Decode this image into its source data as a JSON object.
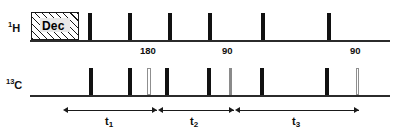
{
  "figure": {
    "type": "nmr-pulse-sequence",
    "width": 398,
    "height": 133,
    "background": "#ffffff"
  },
  "channels": [
    {
      "id": "proton",
      "label_sup": "1",
      "label_main": "H",
      "label_x": 8,
      "label_y": 21,
      "baseline": {
        "x": 30,
        "y": 40,
        "width": 360
      }
    },
    {
      "id": "carbon",
      "label_sup": "13",
      "label_main": "C",
      "label_x": 6,
      "label_y": 78,
      "baseline": {
        "x": 30,
        "y": 95,
        "width": 360
      }
    }
  ],
  "decoupling": {
    "label": "Dec",
    "x": 31,
    "y": 12,
    "width": 48,
    "height": 28,
    "text_x": 42,
    "text_y": 21
  },
  "proton_pulses": [
    {
      "x": 88,
      "y": 13,
      "width": 4,
      "height": 27,
      "style": "solid"
    },
    {
      "x": 128,
      "y": 13,
      "width": 4,
      "height": 27,
      "style": "solid"
    },
    {
      "x": 168,
      "y": 13,
      "width": 4,
      "height": 27,
      "style": "solid"
    },
    {
      "x": 208,
      "y": 13,
      "width": 4,
      "height": 27,
      "style": "solid"
    },
    {
      "x": 261,
      "y": 13,
      "width": 4,
      "height": 27,
      "style": "solid"
    },
    {
      "x": 327,
      "y": 13,
      "width": 4,
      "height": 27,
      "style": "solid"
    }
  ],
  "carbon_pulses": [
    {
      "x": 89,
      "y": 68,
      "width": 4,
      "height": 27,
      "style": "solid"
    },
    {
      "x": 128,
      "y": 68,
      "width": 4,
      "height": 27,
      "style": "solid"
    },
    {
      "x": 147,
      "y": 68,
      "width": 4,
      "height": 27,
      "style": "open"
    },
    {
      "x": 165,
      "y": 68,
      "width": 4,
      "height": 27,
      "style": "solid"
    },
    {
      "x": 207,
      "y": 68,
      "width": 4,
      "height": 27,
      "style": "solid"
    },
    {
      "x": 229,
      "y": 68,
      "width": 3,
      "height": 27,
      "style": "gray"
    },
    {
      "x": 260,
      "y": 68,
      "width": 4,
      "height": 27,
      "style": "solid"
    },
    {
      "x": 325,
      "y": 68,
      "width": 4,
      "height": 27,
      "style": "solid"
    },
    {
      "x": 356,
      "y": 68,
      "width": 3,
      "height": 27,
      "style": "open"
    }
  ],
  "flip_angles": [
    {
      "text": "180",
      "x": 140,
      "y": 46
    },
    {
      "text": "90",
      "x": 222,
      "y": 46
    },
    {
      "text": "90",
      "x": 350,
      "y": 46
    }
  ],
  "timings": [
    {
      "label": "t",
      "sub": "1",
      "line_x": 65,
      "line_y": 110,
      "line_width": 92,
      "left_cap": "arrow",
      "right_cap": "arrow",
      "label_x": 105,
      "label_y": 116
    },
    {
      "label": "t",
      "sub": "2",
      "line_x": 160,
      "line_y": 110,
      "line_width": 74,
      "left_cap": "arrow",
      "right_cap": "arrow",
      "label_x": 190,
      "label_y": 116
    },
    {
      "label": "t",
      "sub": "3",
      "line_x": 237,
      "line_y": 110,
      "line_width": 122,
      "left_cap": "arrow",
      "right_cap": "arrow",
      "label_x": 292,
      "label_y": 116
    }
  ],
  "colors": {
    "ink": "#111111",
    "gray_pulse": "#8a8a8a",
    "open_pulse_border": "#8f8f8f",
    "baseline": "#2b2b2b"
  }
}
